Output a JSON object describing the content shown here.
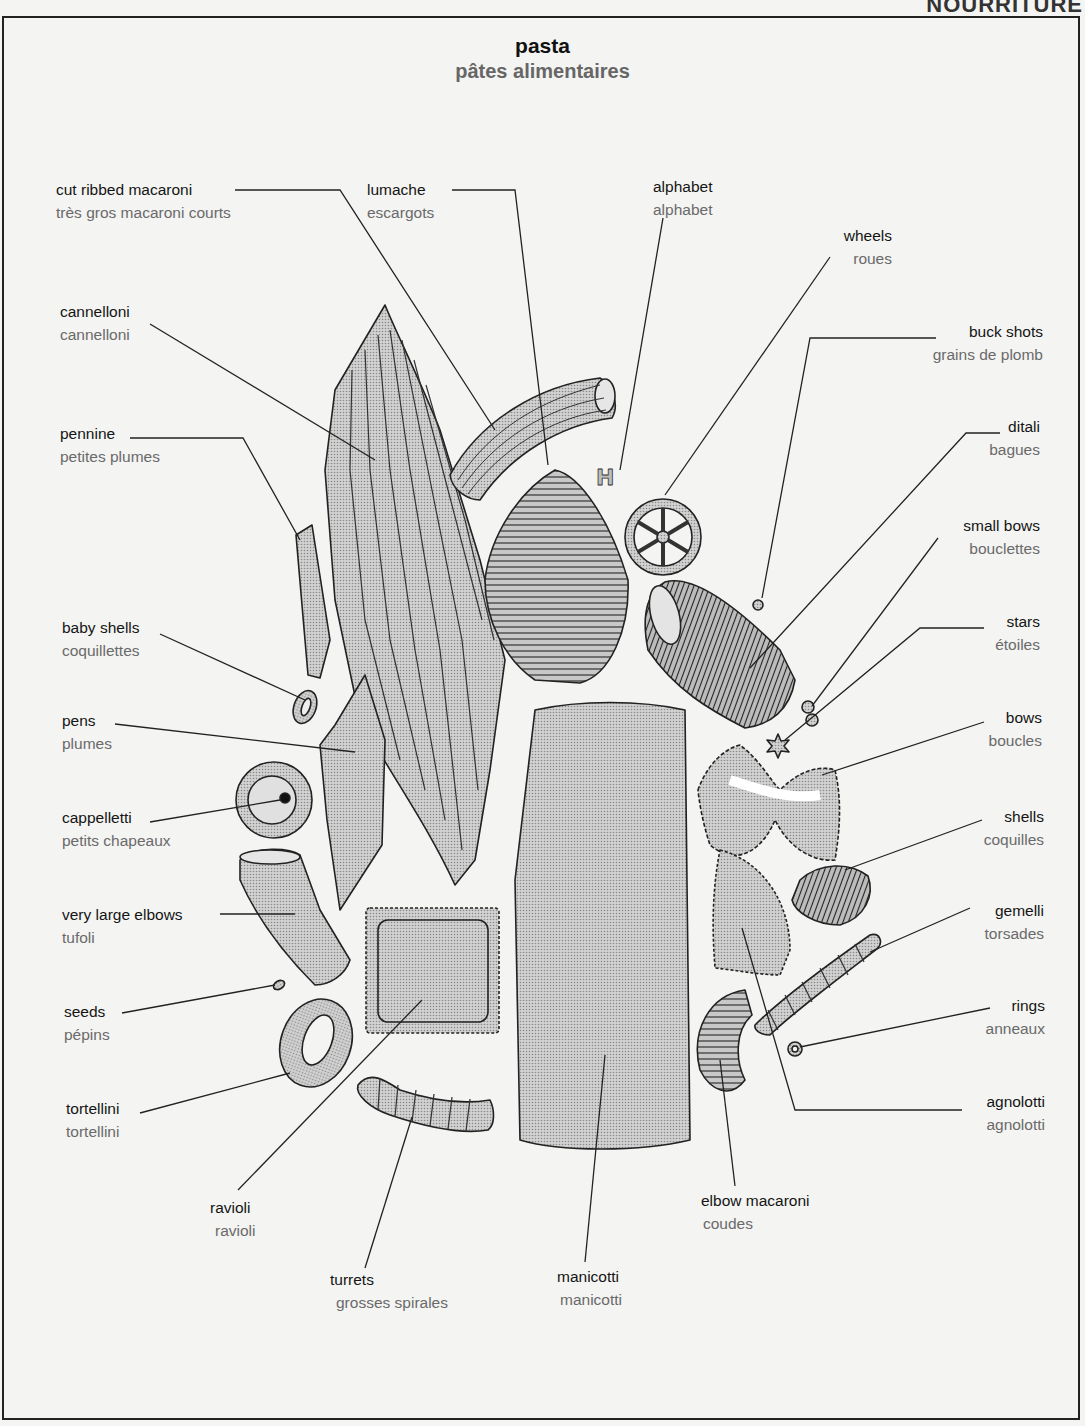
{
  "page": {
    "section_heading": "NOURRITURE",
    "title_en": "pasta",
    "title_fr": "pâtes alimentaires",
    "colors": {
      "ink": "#151515",
      "french_text": "#6a6a6a",
      "pasta_fill": "#c4c4c4",
      "paper": "#f4f4f2"
    }
  },
  "labels": {
    "cut_ribbed_macaroni": {
      "en": "cut ribbed macaroni",
      "fr": "très gros macaroni courts"
    },
    "lumache": {
      "en": "lumache",
      "fr": "escargots"
    },
    "alphabet": {
      "en": "alphabet",
      "fr": "alphabet"
    },
    "wheels": {
      "en": "wheels",
      "fr": "roues"
    },
    "cannelloni": {
      "en": "cannelloni",
      "fr": "cannelloni"
    },
    "buck_shots": {
      "en": "buck shots",
      "fr": "grains de plomb"
    },
    "ditali": {
      "en": "ditali",
      "fr": "bagues"
    },
    "pennine": {
      "en": "pennine",
      "fr": "petites plumes"
    },
    "small_bows": {
      "en": "small bows",
      "fr": "bouclettes"
    },
    "baby_shells": {
      "en": "baby shells",
      "fr": "coquillettes"
    },
    "stars": {
      "en": "stars",
      "fr": "étoiles"
    },
    "pens": {
      "en": "pens",
      "fr": "plumes"
    },
    "bows": {
      "en": "bows",
      "fr": "boucles"
    },
    "cappelletti": {
      "en": "cappelletti",
      "fr": "petits chapeaux"
    },
    "shells": {
      "en": "shells",
      "fr": "coquilles"
    },
    "very_large_elbows": {
      "en": "very large elbows",
      "fr": "tufoli"
    },
    "gemelli": {
      "en": "gemelli",
      "fr": "torsades"
    },
    "seeds": {
      "en": "seeds",
      "fr": "pépins"
    },
    "rings": {
      "en": "rings",
      "fr": "anneaux"
    },
    "tortellini": {
      "en": "tortellini",
      "fr": "tortellini"
    },
    "agnolotti": {
      "en": "agnolotti",
      "fr": "agnolotti"
    },
    "ravioli": {
      "en": "ravioli",
      "fr": "ravioli"
    },
    "elbow_macaroni": {
      "en": "elbow macaroni",
      "fr": "coudes"
    },
    "turrets": {
      "en": "turrets",
      "fr": "grosses spirales"
    },
    "manicotti": {
      "en": "manicotti",
      "fr": "manicotti"
    }
  }
}
